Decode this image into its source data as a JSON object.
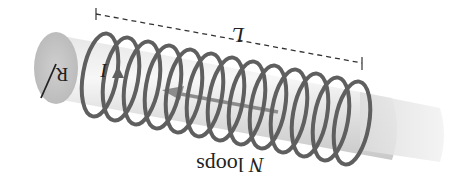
{
  "diagram": {
    "orientation": "rotated 180 degrees",
    "labels": {
      "length": "L",
      "radius": "R",
      "current": "I",
      "loops": "N loops"
    },
    "coil": {
      "loop_count": 13,
      "color": "#5f5f5f"
    },
    "core": {
      "color": "#d9d9d9",
      "end_color": "#c4c4c4"
    },
    "axis_arrow": {
      "color": "#8c8c8c"
    }
  }
}
